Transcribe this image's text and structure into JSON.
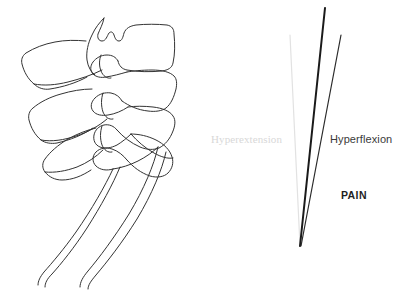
{
  "figure": {
    "background_color": "#ffffff",
    "width": 396,
    "height": 294
  },
  "illustration": {
    "name": "vertebrae-line-drawing",
    "description": "Lateral line drawing of stacked vertebrae with spinous processes and two long descending curves",
    "stroke_color": "#333333",
    "stroke_width": 1,
    "fill": "none"
  },
  "motion_diagram": {
    "vertex": {
      "x": 300,
      "y": 246
    },
    "lines": [
      {
        "name": "hyperextension-line",
        "color": "#e2e2e2",
        "width": 1.2,
        "x1": 290,
        "y1": 35,
        "x2": 300,
        "y2": 246
      },
      {
        "name": "neutral-axis-line",
        "color": "#1a1a1a",
        "width": 2.0,
        "x1": 325,
        "y1": 8,
        "x2": 300,
        "y2": 246
      },
      {
        "name": "hyperflexion-line",
        "color": "#2b2b2b",
        "width": 1.2,
        "x1": 341,
        "y1": 35,
        "x2": 301,
        "y2": 246
      }
    ]
  },
  "labels": {
    "hyperextension": {
      "text": "Hyperextension",
      "color": "#d8d8d8",
      "x": 211,
      "y": 134
    },
    "hyperflexion": {
      "text": "Hyperflexion",
      "color": "#3a3a3a",
      "x": 330,
      "y": 134
    },
    "pain": {
      "text": "PAIN",
      "color": "#1f1f1f",
      "x": 341,
      "y": 190
    }
  }
}
